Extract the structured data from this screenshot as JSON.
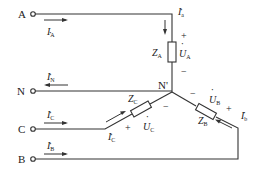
{
  "diagram": {
    "type": "three-phase Y-connected load circuit",
    "terminals": [
      {
        "id": "A",
        "label": "A"
      },
      {
        "id": "N",
        "label": "N"
      },
      {
        "id": "C",
        "label": "C"
      },
      {
        "id": "B",
        "label": "B"
      }
    ],
    "neutral_node": {
      "label": "N'"
    },
    "line_currents": {
      "A": {
        "symbol": "I",
        "sub": "A"
      },
      "N": {
        "symbol": "I",
        "sub": "N"
      },
      "C": {
        "symbol": "I",
        "sub": "C"
      },
      "B": {
        "symbol": "I",
        "sub": "B"
      }
    },
    "phase_currents": {
      "a": {
        "symbol": "I",
        "sub": "a"
      },
      "b": {
        "symbol": "I",
        "sub": "b"
      },
      "c": {
        "symbol": "I",
        "sub": "C"
      }
    },
    "impedances": {
      "A": {
        "symbol": "Z",
        "sub": "A"
      },
      "B": {
        "symbol": "Z",
        "sub": "B"
      },
      "C": {
        "symbol": "Z",
        "sub": "C"
      }
    },
    "voltages": {
      "A": {
        "symbol": "U",
        "sub": "A"
      },
      "B": {
        "symbol": "U",
        "sub": "B"
      },
      "C": {
        "symbol": "U",
        "sub": "C"
      }
    },
    "polarity": {
      "plus": "+",
      "minus": "−"
    }
  }
}
